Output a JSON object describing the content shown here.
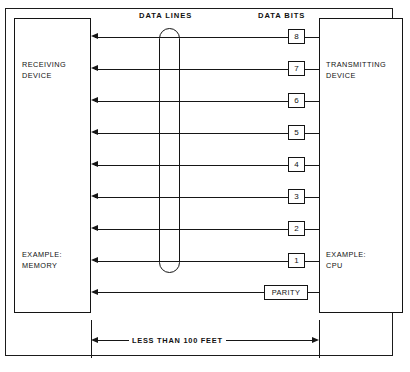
{
  "diagram": {
    "title_labels": {
      "data_lines": "DATA LINES",
      "data_bits": "DATA BITS"
    },
    "left_device": {
      "name": "RECEIVING\nDEVICE",
      "example": "EXAMPLE:\nMEMORY"
    },
    "right_device": {
      "name": "TRANSMITTING\nDEVICE",
      "example": "EXAMPLE:\nCPU"
    },
    "bits": [
      {
        "label": "8",
        "y": 29
      },
      {
        "label": "7",
        "y": 61
      },
      {
        "label": "6",
        "y": 93
      },
      {
        "label": "5",
        "y": 125
      },
      {
        "label": "4",
        "y": 157
      },
      {
        "label": "3",
        "y": 189
      },
      {
        "label": "2",
        "y": 221
      },
      {
        "label": "1",
        "y": 253
      }
    ],
    "parity": {
      "label": "PARITY"
    },
    "dimension": {
      "text": "LESS THAN 100 FEET"
    },
    "colors": {
      "line": "#161616",
      "border": "#141414",
      "frame": "#1b1b1b",
      "background": "#ffffff"
    }
  }
}
